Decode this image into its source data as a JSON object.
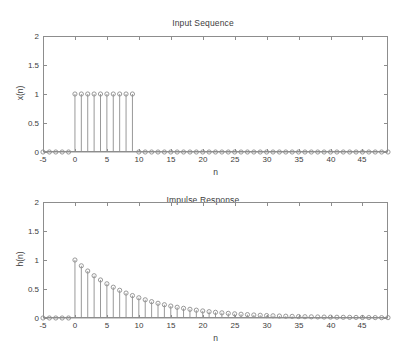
{
  "figure": {
    "width": 406,
    "height": 354,
    "background": "#ffffff",
    "axis_color": "#8d8d8d",
    "text_color": "#3d3d3d"
  },
  "panels": [
    {
      "id": "input",
      "title": "Input Sequence",
      "xlabel": "n",
      "ylabel": "x(n)"
    },
    {
      "id": "impulse",
      "title": "Impulse Response",
      "xlabel": "n",
      "ylabel": "h(n)"
    }
  ],
  "chart_data": [
    {
      "type": "stem",
      "title": "Input Sequence",
      "xlabel": "n",
      "ylabel": "x(n)",
      "xlim": [
        -5,
        49
      ],
      "ylim": [
        0,
        2
      ],
      "xticks": [
        -5,
        0,
        5,
        10,
        15,
        20,
        25,
        30,
        35,
        40,
        45
      ],
      "xticklabels": [
        "-5",
        "0",
        "5",
        "10",
        "15",
        "20",
        "25",
        "30",
        "35",
        "40",
        "45"
      ],
      "yticks": [
        0,
        0.5,
        1,
        1.5,
        2
      ],
      "yticklabels": [
        "0",
        "0.5",
        "1",
        "1.5",
        "2"
      ],
      "grid": false,
      "legend": null,
      "marker": "circle-open",
      "description": "Rectangular pulse: x(n)=1 for 0<=n<=9, else 0",
      "x": [
        -5,
        -4,
        -3,
        -2,
        -1,
        0,
        1,
        2,
        3,
        4,
        5,
        6,
        7,
        8,
        9,
        10,
        11,
        12,
        13,
        14,
        15,
        16,
        17,
        18,
        19,
        20,
        21,
        22,
        23,
        24,
        25,
        26,
        27,
        28,
        29,
        30,
        31,
        32,
        33,
        34,
        35,
        36,
        37,
        38,
        39,
        40,
        41,
        42,
        43,
        44,
        45,
        46,
        47,
        48,
        49
      ],
      "values": [
        0,
        0,
        0,
        0,
        0,
        1,
        1,
        1,
        1,
        1,
        1,
        1,
        1,
        1,
        1,
        0,
        0,
        0,
        0,
        0,
        0,
        0,
        0,
        0,
        0,
        0,
        0,
        0,
        0,
        0,
        0,
        0,
        0,
        0,
        0,
        0,
        0,
        0,
        0,
        0,
        0,
        0,
        0,
        0,
        0,
        0,
        0,
        0,
        0,
        0,
        0,
        0,
        0,
        0,
        0
      ]
    },
    {
      "type": "stem",
      "title": "Impulse Response",
      "xlabel": "n",
      "ylabel": "h(n)",
      "xlim": [
        -5,
        49
      ],
      "ylim": [
        0,
        2
      ],
      "xticks": [
        -5,
        0,
        5,
        10,
        15,
        20,
        25,
        30,
        35,
        40,
        45
      ],
      "xticklabels": [
        "-5",
        "0",
        "5",
        "10",
        "15",
        "20",
        "25",
        "30",
        "35",
        "40",
        "45"
      ],
      "yticks": [
        0,
        0.5,
        1,
        1.5,
        2
      ],
      "yticklabels": [
        "0",
        "0.5",
        "1",
        "1.5",
        "2"
      ],
      "grid": false,
      "legend": null,
      "marker": "circle-open",
      "description": "Exponentially decaying impulse response h(n)=0.9^n for n>=0, else 0",
      "x": [
        -5,
        -4,
        -3,
        -2,
        -1,
        0,
        1,
        2,
        3,
        4,
        5,
        6,
        7,
        8,
        9,
        10,
        11,
        12,
        13,
        14,
        15,
        16,
        17,
        18,
        19,
        20,
        21,
        22,
        23,
        24,
        25,
        26,
        27,
        28,
        29,
        30,
        31,
        32,
        33,
        34,
        35,
        36,
        37,
        38,
        39,
        40,
        41,
        42,
        43,
        44,
        45,
        46,
        47,
        48,
        49
      ],
      "values": [
        0,
        0,
        0,
        0,
        0,
        1,
        0.9,
        0.81,
        0.729,
        0.656,
        0.59,
        0.531,
        0.478,
        0.43,
        0.387,
        0.349,
        0.314,
        0.282,
        0.254,
        0.229,
        0.206,
        0.185,
        0.167,
        0.15,
        0.135,
        0.122,
        0.109,
        0.098,
        0.089,
        0.08,
        0.072,
        0.065,
        0.058,
        0.052,
        0.047,
        0.042,
        0.038,
        0.034,
        0.031,
        0.028,
        0.025,
        0.022,
        0.02,
        0.018,
        0.016,
        0.015,
        0.013,
        0.012,
        0.011,
        0.01,
        0.009,
        0.008,
        0.007,
        0.006,
        0.006
      ]
    }
  ]
}
